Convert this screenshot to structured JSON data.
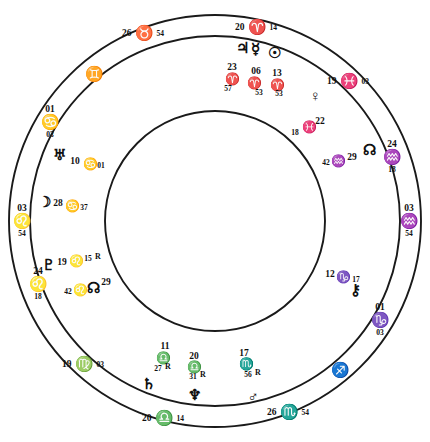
{
  "chart": {
    "type": "astrological-natal-wheel",
    "title": "",
    "center_x": 215,
    "center_y": 221,
    "radii": {
      "outer": 207,
      "sign_band_inner": 186,
      "house_band_inner": 110
    },
    "colors": {
      "ink": "#101010",
      "line": "#1a1a1a",
      "spoke": "#6b6b6b",
      "background": "#ffffff"
    }
  },
  "house_cusps": [
    {
      "id": "cusp-1",
      "deg": "03",
      "sign_glyph": "♌",
      "sign_name": "Leo",
      "min": "54",
      "angle_deg": 180,
      "x": 22,
      "y": 221
    },
    {
      "id": "cusp-2",
      "deg": "24",
      "sign_glyph": "♌",
      "sign_name": "Leo",
      "min": "18",
      "angle_deg": 208,
      "x": 38,
      "y": 284
    },
    {
      "id": "cusp-3",
      "deg": "19",
      "sign_glyph": "♍",
      "sign_name": "Virgo",
      "min": "03",
      "angle_deg": 236,
      "x": 83,
      "y": 363
    },
    {
      "id": "cusp-4",
      "deg": "20",
      "sign_glyph": "♎",
      "sign_name": "Libra",
      "min": "14",
      "angle_deg": 268,
      "x": 163,
      "y": 417
    },
    {
      "id": "cusp-5",
      "deg": "26",
      "sign_glyph": "♏",
      "sign_name": "Scorpio",
      "min": "54",
      "angle_deg": 296,
      "x": 288,
      "y": 411
    },
    {
      "id": "cusp-6",
      "deg": "01",
      "sign_glyph": "♑",
      "sign_name": "Capricorn",
      "min": "03",
      "angle_deg": 333,
      "x": 380,
      "y": 320
    },
    {
      "id": "cusp-7",
      "deg": "03",
      "sign_glyph": "♒",
      "sign_name": "Aquarius",
      "min": "54",
      "angle_deg": 0,
      "x": 409,
      "y": 221
    },
    {
      "id": "cusp-8",
      "deg": "24",
      "sign_glyph": "♒",
      "sign_name": "Aquarius",
      "min": "18",
      "angle_deg": 28,
      "x": 392,
      "y": 157
    },
    {
      "id": "cusp-9",
      "deg": "19",
      "sign_glyph": "♓",
      "sign_name": "Pisces",
      "min": "03",
      "angle_deg": 56,
      "x": 348,
      "y": 80
    },
    {
      "id": "cusp-10",
      "deg": "20",
      "sign_glyph": "♈",
      "sign_name": "Aries",
      "min": "14",
      "angle_deg": 88,
      "x": 256,
      "y": 26
    },
    {
      "id": "cusp-11",
      "deg": "26",
      "sign_glyph": "♉",
      "sign_name": "Taurus",
      "min": "54",
      "angle_deg": 116,
      "x": 143,
      "y": 32
    },
    {
      "id": "cusp-12",
      "deg": "01",
      "sign_glyph": "♋",
      "sign_name": "Cancer",
      "min": "03",
      "angle_deg": 153,
      "x": 50,
      "y": 122
    }
  ],
  "sign_band_labels": [
    {
      "id": "band-gemini",
      "glyph": "♊",
      "sign_name": "Gemini",
      "x": 94,
      "y": 74
    },
    {
      "id": "band-sagittarius",
      "glyph": "♐",
      "sign_name": "Sagittarius",
      "x": 340,
      "y": 370
    }
  ],
  "planets": [
    {
      "id": "planet-uranus",
      "glyph": "♅",
      "name": "Uranus",
      "deg": "10",
      "sign_glyph": "♋",
      "sign_name": "Cancer",
      "min": "01",
      "retrograde": false,
      "glyph_x": 59,
      "glyph_y": 155,
      "deg_x": 75,
      "deg_y": 162,
      "sign_x": 90,
      "sign_y": 164,
      "min_x": 101,
      "min_y": 166
    },
    {
      "id": "planet-moon",
      "glyph": "☽",
      "name": "Moon",
      "deg": "28",
      "sign_glyph": "♋",
      "sign_name": "Cancer",
      "min": "37",
      "retrograde": false,
      "glyph_x": 44,
      "glyph_y": 202,
      "deg_x": 58,
      "deg_y": 204,
      "sign_x": 72,
      "sign_y": 206,
      "min_x": 84,
      "min_y": 208
    },
    {
      "id": "planet-pluto",
      "glyph": "♇",
      "name": "Pluto",
      "deg": "19",
      "sign_glyph": "♌",
      "sign_name": "Leo",
      "min": "15",
      "retrograde": true,
      "glyph_x": 48,
      "glyph_y": 265,
      "deg_x": 62,
      "deg_y": 263,
      "sign_x": 76,
      "sign_y": 261,
      "min_x": 88,
      "min_y": 259
    },
    {
      "id": "planet-southnode",
      "glyph": "☊",
      "name": "South Node",
      "deg": "29",
      "sign_glyph": "♌",
      "sign_name": "Leo",
      "min": "42",
      "retrograde": false,
      "glyph_x": 93,
      "glyph_y": 288,
      "deg_x": 106,
      "deg_y": 283,
      "sign_x": 80,
      "sign_y": 290,
      "min_x": 68,
      "min_y": 292
    },
    {
      "id": "planet-saturn",
      "glyph": "♄",
      "name": "Saturn",
      "deg": "11",
      "sign_glyph": "♎",
      "sign_name": "Libra",
      "min": "27",
      "retrograde": true,
      "glyph_x": 148,
      "glyph_y": 384,
      "deg_x": 165,
      "deg_y": 347,
      "sign_x": 163,
      "sign_y": 358,
      "min_x": 158,
      "min_y": 369
    },
    {
      "id": "planet-neptune",
      "glyph": "♆",
      "name": "Neptune",
      "deg": "20",
      "sign_glyph": "♎",
      "sign_name": "Libra",
      "min": "31",
      "retrograde": true,
      "glyph_x": 194,
      "glyph_y": 395,
      "deg_x": 194,
      "deg_y": 357,
      "sign_x": 194,
      "sign_y": 367,
      "min_x": 193,
      "min_y": 377
    },
    {
      "id": "planet-mars",
      "glyph": "♂",
      "name": "Mars",
      "deg": "17",
      "sign_glyph": "♏",
      "sign_name": "Scorpio",
      "min": "56",
      "retrograde": true,
      "glyph_x": 253,
      "glyph_y": 397,
      "deg_x": 244,
      "deg_y": 354,
      "sign_x": 246,
      "sign_y": 364,
      "min_x": 248,
      "min_y": 375
    },
    {
      "id": "planet-chiron",
      "glyph": "⚷",
      "name": "Chiron",
      "deg": "12",
      "sign_glyph": "♑",
      "sign_name": "Capricorn",
      "min": "17",
      "retrograde": false,
      "glyph_x": 355,
      "glyph_y": 290,
      "deg_x": 330,
      "deg_y": 275,
      "sign_x": 343,
      "sign_y": 277,
      "min_x": 356,
      "min_y": 280
    },
    {
      "id": "planet-northnode",
      "glyph": "☊",
      "name": "North Node",
      "deg": "29",
      "sign_glyph": "♒",
      "sign_name": "Aquarius",
      "min": "42",
      "retrograde": false,
      "glyph_x": 369,
      "glyph_y": 150,
      "deg_x": 352,
      "deg_y": 158,
      "sign_x": 338,
      "sign_y": 161,
      "min_x": 326,
      "min_y": 163
    },
    {
      "id": "planet-venus",
      "glyph": "♀",
      "name": "Venus",
      "deg": "22",
      "sign_glyph": "♓",
      "sign_name": "Pisces",
      "min": "18",
      "retrograde": false,
      "glyph_x": 315,
      "glyph_y": 96,
      "deg_x": 320,
      "deg_y": 122,
      "sign_x": 309,
      "sign_y": 127,
      "min_x": 295,
      "min_y": 133
    },
    {
      "id": "planet-jupiter",
      "glyph": "♃",
      "name": "Jupiter",
      "deg": "23",
      "sign_glyph": "♈",
      "sign_name": "Aries",
      "min": "57",
      "retrograde": false,
      "glyph_x": 242,
      "glyph_y": 48,
      "deg_x": 232,
      "deg_y": 68,
      "sign_x": 232,
      "sign_y": 79,
      "min_x": 228,
      "min_y": 89
    },
    {
      "id": "planet-mercury",
      "glyph": "☿",
      "name": "Mercury",
      "deg": "06",
      "sign_glyph": "♈",
      "sign_name": "Aries",
      "min": "53",
      "retrograde": false,
      "glyph_x": 255,
      "glyph_y": 49,
      "deg_x": 256,
      "deg_y": 72,
      "sign_x": 254,
      "sign_y": 83,
      "min_x": 259,
      "min_y": 93
    },
    {
      "id": "planet-sun",
      "glyph": "☉",
      "name": "Sun",
      "deg": "13",
      "sign_glyph": "♈",
      "sign_name": "Aries",
      "min": "53",
      "retrograde": false,
      "glyph_x": 274,
      "glyph_y": 53,
      "deg_x": 277,
      "deg_y": 74,
      "sign_x": 277,
      "sign_y": 85,
      "min_x": 279,
      "min_y": 94
    }
  ],
  "retrograde_symbol": "R"
}
